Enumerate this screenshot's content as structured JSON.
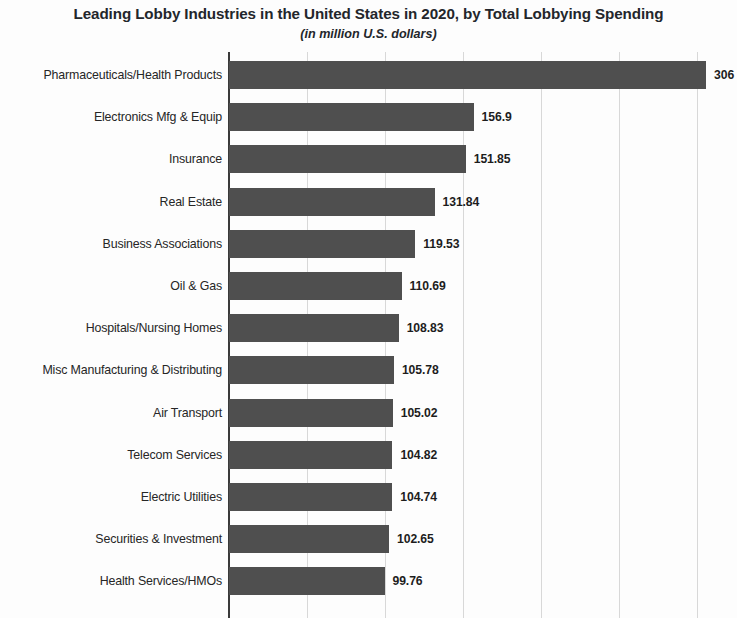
{
  "chart_data": {
    "type": "bar",
    "orientation": "horizontal",
    "title": "Leading Lobby Industries in the United States in 2020, by Total Lobbying Spending",
    "subtitle": "(in million U.S. dollars)",
    "xlabel": "",
    "ylabel": "",
    "xlim": [
      0,
      320
    ],
    "grid": true,
    "gridlines": [
      50,
      100,
      150,
      200,
      250,
      300
    ],
    "legend": "none",
    "bar_color": "#4f4f4f",
    "categories": [
      "Pharmaceuticals/Health Products",
      "Electronics Mfg & Equip",
      "Insurance",
      "Real Estate",
      "Business Associations",
      "Oil & Gas",
      "Hospitals/Nursing Homes",
      "Misc Manufacturing & Distributing",
      "Air Transport",
      "Telecom Services",
      "Electric Utilities",
      "Securities & Investment",
      "Health Services/HMOs"
    ],
    "values": [
      306,
      156.9,
      151.85,
      131.84,
      119.53,
      110.69,
      108.83,
      105.78,
      105.02,
      104.82,
      104.74,
      102.65,
      99.76
    ],
    "value_labels": [
      "306",
      "156.9",
      "151.85",
      "131.84",
      "119.53",
      "110.69",
      "108.83",
      "105.78",
      "105.02",
      "104.82",
      "104.74",
      "102.65",
      "99.76"
    ],
    "series": [
      {
        "name": "Total Lobbying Spending",
        "values": [
          306,
          156.9,
          151.85,
          131.84,
          119.53,
          110.69,
          108.83,
          105.78,
          105.02,
          104.82,
          104.74,
          102.65,
          99.76
        ]
      }
    ]
  }
}
